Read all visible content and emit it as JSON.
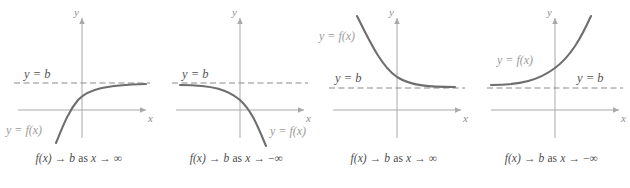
{
  "figure": {
    "type": "math-diagram",
    "colors": {
      "curve": "#6e6e6e",
      "asymptote": "#8a8a8a",
      "axis": "#a9a9a9",
      "label_fx": "#9b9b9b",
      "label_b": "#555555",
      "caption": "#4c4c4c",
      "background": "#ffffff"
    }
  },
  "panels": [
    {
      "id": "panel-1",
      "axis_x_label": "x",
      "axis_y_label": "y",
      "asymptote_label": "y = b",
      "function_label": "y = f(x)",
      "caption_prefix": "f(x)",
      "caption_arrow1": "→",
      "caption_b": "b",
      "caption_as": "as",
      "caption_x": "x",
      "caption_arrow2": "→",
      "caption_limit": "∞",
      "caption_full": "f(x) → b as x → ∞",
      "curve_shape": "increasing-concave-down approaching b from below as x→+∞",
      "asymptote_from": "below",
      "limit_direction": "+infinity"
    },
    {
      "id": "panel-2",
      "axis_x_label": "x",
      "axis_y_label": "y",
      "asymptote_label": "y = b",
      "function_label": "y = f(x)",
      "caption_prefix": "f(x)",
      "caption_arrow1": "→",
      "caption_b": "b",
      "caption_as": "as",
      "caption_x": "x",
      "caption_arrow2": "→",
      "caption_limit": "−∞",
      "caption_full": "f(x) → b as x → −∞",
      "curve_shape": "decreasing-concave-down approaching b from below as x→−∞",
      "asymptote_from": "below",
      "limit_direction": "-infinity"
    },
    {
      "id": "panel-3",
      "axis_x_label": "x",
      "axis_y_label": "y",
      "asymptote_label": "y = b",
      "function_label": "y = f(x)",
      "caption_prefix": "f(x)",
      "caption_arrow1": "→",
      "caption_b": "b",
      "caption_as": "as",
      "caption_x": "x",
      "caption_arrow2": "→",
      "caption_limit": "∞",
      "caption_full": "f(x) → b as x → ∞",
      "curve_shape": "decreasing-convex approaching b from above as x→+∞",
      "asymptote_from": "above",
      "limit_direction": "+infinity"
    },
    {
      "id": "panel-4",
      "axis_x_label": "x",
      "axis_y_label": "y",
      "asymptote_label": "y = b",
      "function_label": "y = f(x)",
      "caption_prefix": "f(x)",
      "caption_arrow1": "→",
      "caption_b": "b",
      "caption_as": "as",
      "caption_x": "x",
      "caption_arrow2": "→",
      "caption_limit": "−∞",
      "caption_full": "f(x) → b as x → −∞",
      "curve_shape": "increasing-convex approaching b from above as x→−∞",
      "asymptote_from": "above",
      "limit_direction": "-infinity"
    }
  ]
}
